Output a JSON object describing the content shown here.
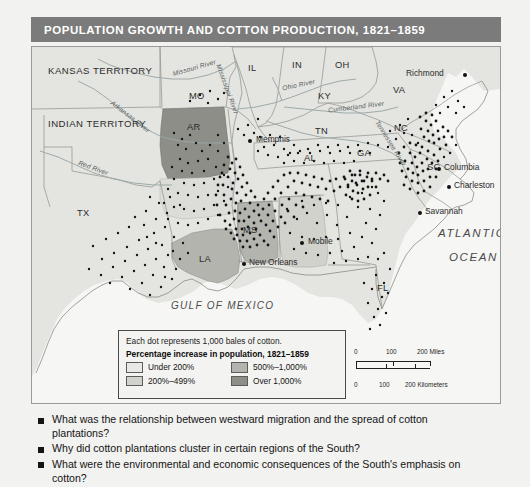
{
  "title": {
    "main": "POPULATION GROWTH AND COTTON PRODUCTION,",
    "years": "1821–1859",
    "full": "POPULATION GROWTH AND COTTON PRODUCTION, 1821–1859"
  },
  "colors": {
    "title_bar": "#7b7b7b",
    "page_background": "#f2f2f0",
    "map_land": "#e4e4e0",
    "map_water": "#f6f6f5",
    "under_200": "#e8e8e4",
    "pct_200_499": "#d2d2cd",
    "pct_500_1000": "#b4b4ae",
    "over_1000": "#8e8e88",
    "dot_color": "#151515",
    "border": "#4a4a4a"
  },
  "legend": {
    "note": "Each dot represents 1,000 bales of cotton.",
    "heading": "Percentage increase in population, 1821–1859",
    "classes": [
      {
        "label": "Under 200%",
        "color": "#e8e8e4"
      },
      {
        "label": "500%–1,000%",
        "color": "#b4b4ae"
      },
      {
        "label": "200%–499%",
        "color": "#d2d2cd"
      },
      {
        "label": "Over 1,000%",
        "color": "#8e8e88"
      }
    ]
  },
  "scale_bar": {
    "miles": {
      "unit": "Miles",
      "ticks": [
        "0",
        "100",
        "200 Miles"
      ]
    },
    "kilometers": {
      "unit": "Kilometers",
      "ticks": [
        "0",
        "100",
        "200 Kilometers"
      ]
    }
  },
  "map": {
    "states": [
      {
        "name": "KANSAS TERRITORY",
        "x": 53,
        "y": 24,
        "type": "territory",
        "shade": "under_200"
      },
      {
        "name": "INDIAN TERRITORY",
        "x": 50,
        "y": 78,
        "type": "territory",
        "shade": "under_200"
      },
      {
        "name": "MO",
        "x": 163,
        "y": 48,
        "type": "state",
        "shade": "under_200"
      },
      {
        "name": "IL",
        "x": 221,
        "y": 20,
        "type": "state",
        "shade": "under_200"
      },
      {
        "name": "IN",
        "x": 265,
        "y": 16,
        "type": "state",
        "shade": "under_200"
      },
      {
        "name": "OH",
        "x": 308,
        "y": 16,
        "type": "state",
        "shade": "under_200"
      },
      {
        "name": "KY",
        "x": 290,
        "y": 48,
        "type": "state",
        "shade": "under_200"
      },
      {
        "name": "TN",
        "x": 287,
        "y": 83,
        "type": "state",
        "shade": "under_200"
      },
      {
        "name": "VA",
        "x": 366,
        "y": 42,
        "type": "state",
        "shade": "under_200"
      },
      {
        "name": "NC",
        "x": 367,
        "y": 80,
        "type": "state",
        "shade": "under_200"
      },
      {
        "name": "SC",
        "x": 399,
        "y": 119,
        "type": "state",
        "shade": "under_200"
      },
      {
        "name": "GA",
        "x": 330,
        "y": 105,
        "type": "state",
        "shade": "under_200"
      },
      {
        "name": "AL",
        "x": 277,
        "y": 110,
        "type": "state",
        "shade": "pct_200_499"
      },
      {
        "name": "MS",
        "x": 216,
        "y": 182,
        "type": "state",
        "shade": "pct_500_1000"
      },
      {
        "name": "AR",
        "x": 160,
        "y": 79,
        "type": "state",
        "shade": "over_1000"
      },
      {
        "name": "LA",
        "x": 172,
        "y": 211,
        "type": "state",
        "shade": "pct_500_1000"
      },
      {
        "name": "TX",
        "x": 50,
        "y": 165,
        "type": "state",
        "shade": "under_200"
      },
      {
        "name": "FL",
        "x": 350,
        "y": 240,
        "type": "state",
        "shade": "under_200"
      }
    ],
    "cities": [
      {
        "name": "Memphis",
        "x": 218,
        "y": 94,
        "label_dx": 6,
        "label_dy": -4
      },
      {
        "name": "Richmond",
        "x": 433,
        "y": 28,
        "label_dx": -59,
        "label_dy": -4
      },
      {
        "name": "Columbia",
        "x": 407,
        "y": 122,
        "label_dx": 5,
        "label_dy": -4
      },
      {
        "name": "Charleston",
        "x": 417,
        "y": 140,
        "label_dx": 6,
        "label_dy": -4
      },
      {
        "name": "Savannah",
        "x": 388,
        "y": 166,
        "label_dx": 6,
        "label_dy": -4
      },
      {
        "name": "Mobile",
        "x": 270,
        "y": 196,
        "label_dx": 6,
        "label_dy": -4
      },
      {
        "name": "New Orleans",
        "x": 212,
        "y": 217,
        "label_dx": 5,
        "label_dy": -3
      }
    ],
    "water_bodies": [
      {
        "name": "ATLANTIC",
        "x": 413,
        "y": 186
      },
      {
        "name": "OCEAN",
        "x": 424,
        "y": 210
      },
      {
        "name": "GULF OF MEXICO",
        "x": 172,
        "y": 258
      }
    ],
    "rivers": [
      {
        "name": "Missouri River",
        "x": 180,
        "y": 27,
        "rot": -26
      },
      {
        "name": "Mississippi River",
        "x": 205,
        "y": 20,
        "rot": 68
      },
      {
        "name": "Arkansas River",
        "x": 97,
        "y": 58,
        "rot": 36
      },
      {
        "name": "Red River",
        "x": 64,
        "y": 118,
        "rot": 20
      },
      {
        "name": "Ohio River",
        "x": 262,
        "y": 38,
        "rot": 12
      },
      {
        "name": "Cumberland River",
        "x": 320,
        "y": 59,
        "rot": 12
      },
      {
        "name": "Tennessee River",
        "x": 357,
        "y": 78,
        "rot": 56
      }
    ]
  },
  "questions": [
    "What was the relationship between westward migration and the spread of cotton plantations?",
    "Why did cotton plantations cluster in certain regions of the South?",
    "What were the environmental and economic consequences of the South's emphasis on cotton?"
  ]
}
